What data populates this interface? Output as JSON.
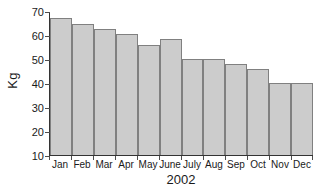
{
  "chart_data": {
    "type": "bar",
    "title": "",
    "xlabel": "2002",
    "ylabel": "Kg",
    "categories": [
      "Jan",
      "Feb",
      "Mar",
      "Apr",
      "May",
      "June",
      "July",
      "Aug",
      "Sep",
      "Oct",
      "Nov",
      "Dec"
    ],
    "values": [
      67,
      64.5,
      62.5,
      60.5,
      56,
      58.5,
      50,
      50,
      48,
      46,
      40,
      40
    ],
    "ylim": [
      10,
      70
    ],
    "yticks": [
      10,
      20,
      30,
      40,
      50,
      60,
      70
    ],
    "ytick_labels": [
      "10",
      "20",
      "30",
      "40",
      "50",
      "60",
      "70"
    ],
    "grid": false,
    "legend": false,
    "series": [
      {
        "name": "Kg",
        "values": [
          67,
          64.5,
          62.5,
          60.5,
          56,
          58.5,
          50,
          50,
          48,
          46,
          40,
          40
        ]
      }
    ]
  },
  "style": {
    "bar_fill": "#cccccc",
    "bar_stroke": "#808080",
    "axis_color": "#333333",
    "text_color": "#1a1a1a",
    "background": "#ffffff"
  }
}
